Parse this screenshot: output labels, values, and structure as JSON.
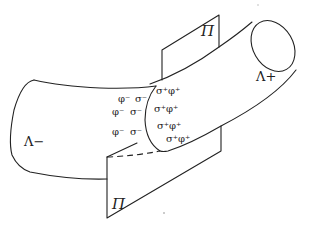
{
  "figure": {
    "type": "diagram",
    "labels": {
      "left_region": "Λ−",
      "right_region": "Λ+",
      "plane_top": "Π",
      "plane_bottom": "Π"
    },
    "left_charges": [
      [
        "φ⁻",
        "σ⁻"
      ],
      [
        "φ⁻",
        "σ⁻"
      ],
      [
        "φ⁻",
        "σ⁻"
      ]
    ],
    "right_charges": [
      [
        "σ⁺",
        "φ⁺"
      ],
      [
        "σ⁺",
        "φ⁺"
      ],
      [
        "σ⁺",
        "φ⁺"
      ],
      [
        "σ⁺",
        "φ⁺"
      ]
    ],
    "colors": {
      "ink": "#222222",
      "background": "#ffffff"
    }
  }
}
